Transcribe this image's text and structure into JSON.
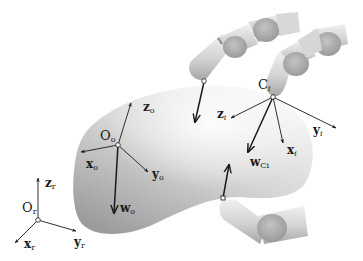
{
  "diagram": {
    "type": "grasp-kinematics-illustration",
    "colors": {
      "background": "#ffffff",
      "object_light": "#f2f2f2",
      "object_dark": "#9a9a9a",
      "finger_light": "#e6e6e6",
      "finger_dark": "#a8a8a8",
      "arrow": "#1a1a1a"
    },
    "frames": {
      "object": {
        "origin": "O",
        "origin_sub": "o",
        "axes": [
          {
            "name": "z",
            "sub": "o"
          },
          {
            "name": "x",
            "sub": "o"
          },
          {
            "name": "y",
            "sub": "o"
          }
        ],
        "wrench": {
          "name": "w",
          "sub": "o"
        }
      },
      "contact": {
        "origin": "C",
        "origin_sub": "i",
        "axes": [
          {
            "name": "z",
            "sub": "i"
          },
          {
            "name": "y",
            "sub": "i"
          },
          {
            "name": "x",
            "sub": "i"
          }
        ],
        "wrench": {
          "name": "w",
          "sub": "Ci"
        }
      },
      "reference": {
        "origin": "O",
        "origin_sub": "r",
        "axes": [
          {
            "name": "z",
            "sub": "r"
          },
          {
            "name": "x",
            "sub": "r"
          },
          {
            "name": "y",
            "sub": "r"
          }
        ]
      }
    },
    "fingers": [
      {
        "id": "finger-top-left",
        "contact_force_direction": "into-object"
      },
      {
        "id": "finger-top-right",
        "contact_label": "Ci"
      },
      {
        "id": "finger-bottom",
        "contact_force_direction": "into-object"
      }
    ]
  }
}
